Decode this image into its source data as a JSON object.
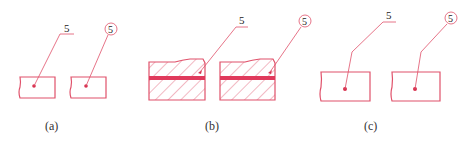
{
  "colors": {
    "line": "#e0516a",
    "band": "#e03a5c",
    "text": "#222222"
  },
  "panels": [
    {
      "id": "a",
      "caption": "(a)",
      "items": [
        {
          "style": "underline",
          "number": "5",
          "section": "plain"
        },
        {
          "style": "circled",
          "number": "5",
          "section": "plain"
        }
      ]
    },
    {
      "id": "b",
      "caption": "(b)",
      "items": [
        {
          "style": "underline",
          "number": "5",
          "section": "hatched-with-band"
        },
        {
          "style": "circled",
          "number": "5",
          "section": "hatched-with-band"
        }
      ]
    },
    {
      "id": "c",
      "caption": "(c)",
      "items": [
        {
          "style": "underline",
          "number": "5",
          "section": "plain"
        },
        {
          "style": "circled",
          "number": "5",
          "section": "plain"
        }
      ]
    }
  ]
}
